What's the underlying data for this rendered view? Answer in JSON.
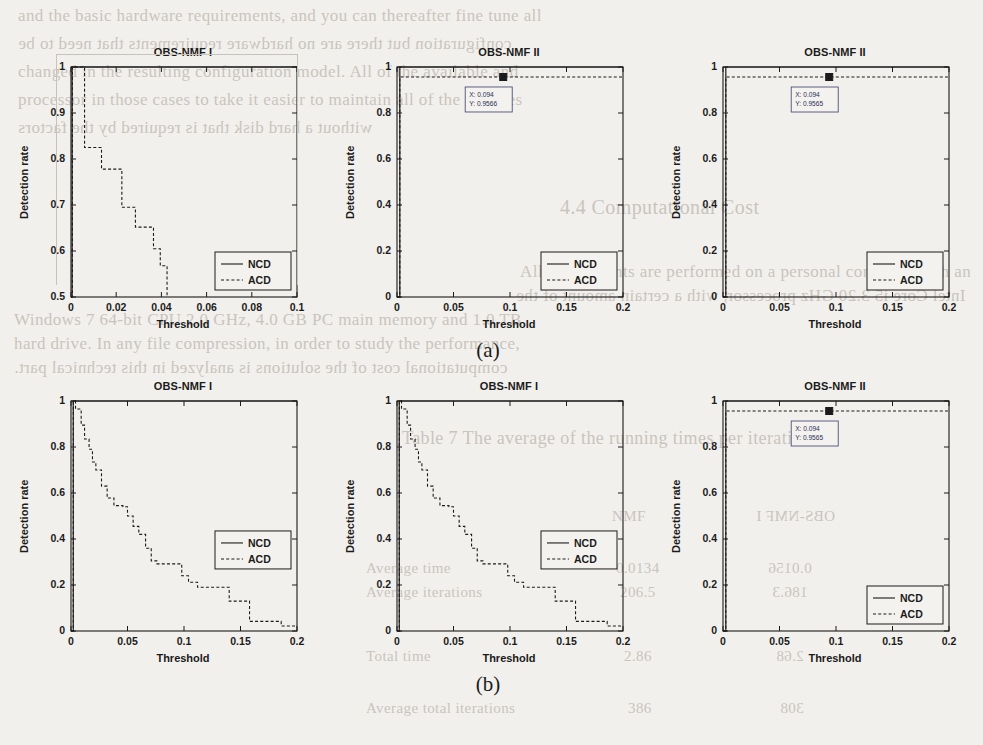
{
  "page": {
    "background_color": "#f2f0ec",
    "ink_color": "#1b1b1b",
    "bleed_color": "#b9b4ac",
    "subfigure_labels": [
      {
        "text": "(a)",
        "x": 458,
        "y": 338
      },
      {
        "text": "(b)",
        "x": 458,
        "y": 672
      }
    ],
    "bleed_text": [
      {
        "text": "and the basic hardware requirements, and you can thereafter fine tune all",
        "x": 18,
        "y": 6,
        "size": 17
      },
      {
        "text": "configuration but there are no hardware requirements that need to be",
        "x": 18,
        "y": 34,
        "size": 17
      },
      {
        "text": "changed in the resulting configuration model. All of the available and",
        "x": 18,
        "y": 62,
        "size": 17
      },
      {
        "text": "processor in those cases to take it easier to maintain all of the changes",
        "x": 18,
        "y": 90,
        "size": 17
      },
      {
        "text": "without a hard disk that is required by the factors",
        "x": 18,
        "y": 118,
        "size": 17
      },
      {
        "text": "4.4  Computational Cost",
        "x": 560,
        "y": 196,
        "size": 20
      },
      {
        "text": "All experiments are performed on a personal computer with an",
        "x": 520,
        "y": 262,
        "size": 17
      },
      {
        "text": "Intel Core i5 3.20 GHz processor, with a certain amount of the",
        "x": 516,
        "y": 286,
        "size": 17
      },
      {
        "text": "Windows 7 64-bit CPU  2.0 GHz, 4.0 GB  PC main memory and 1.0 TB",
        "x": 14,
        "y": 310,
        "size": 17
      },
      {
        "text": "hard drive. In any file compression, in order to study the performance,",
        "x": 14,
        "y": 334,
        "size": 17
      },
      {
        "text": "computational cost of the solutions is analyzed in this technical part.",
        "x": 14,
        "y": 358,
        "size": 17
      },
      {
        "text": "Table 7  The average of the running times per iteration",
        "x": 402,
        "y": 428,
        "size": 18
      },
      {
        "text": "NMF",
        "x": 612,
        "y": 508,
        "size": 15
      },
      {
        "text": "OBS-NMF I",
        "x": 756,
        "y": 508,
        "size": 15
      },
      {
        "text": "Average time",
        "x": 366,
        "y": 560,
        "size": 15
      },
      {
        "text": "0.0134",
        "x": 616,
        "y": 560,
        "size": 15
      },
      {
        "text": "0.0156",
        "x": 768,
        "y": 560,
        "size": 15
      },
      {
        "text": "Average iterations",
        "x": 366,
        "y": 584,
        "size": 15
      },
      {
        "text": "206.5",
        "x": 620,
        "y": 584,
        "size": 15
      },
      {
        "text": "186.3",
        "x": 772,
        "y": 584,
        "size": 15
      },
      {
        "text": "Total time",
        "x": 366,
        "y": 648,
        "size": 15
      },
      {
        "text": "2.86",
        "x": 624,
        "y": 648,
        "size": 15
      },
      {
        "text": "2.68",
        "x": 776,
        "y": 648,
        "size": 15
      },
      {
        "text": "Average total iterations",
        "x": 366,
        "y": 700,
        "size": 15
      },
      {
        "text": "386",
        "x": 628,
        "y": 700,
        "size": 15
      },
      {
        "text": "308",
        "x": 780,
        "y": 700,
        "size": 15
      }
    ]
  },
  "chart_data": [
    {
      "id": "panel-top-left",
      "type": "line",
      "title": "OBS-NMF I",
      "xlabel": "Threshold",
      "ylabel": "Detection rate",
      "xlim": [
        0,
        0.1
      ],
      "ylim": [
        0.5,
        1.0
      ],
      "xticks": [
        0,
        0.02,
        0.04,
        0.06,
        0.08,
        0.1
      ],
      "xticklabels": [
        "0",
        "0.02",
        "0.04",
        "0.06",
        "0.08",
        "0.1"
      ],
      "yticks": [
        0.5,
        0.6,
        0.7,
        0.8,
        0.9,
        1.0
      ],
      "yticklabels": [
        "0.5",
        "0.6",
        "0.7",
        "0.8",
        "0.9",
        "1"
      ],
      "grid": false,
      "legend_position": "lower right",
      "legend": [
        "NCD",
        "ACD"
      ],
      "series": [
        {
          "name": "NCD",
          "style": "solid",
          "x": [
            0.0,
            0.0005,
            0.0005,
            0.1
          ],
          "y": [
            0.5,
            0.5,
            1.0,
            1.0
          ]
        },
        {
          "name": "ACD",
          "style": "dashed",
          "x": [
            0.0,
            0.0006,
            0.0006,
            0.006,
            0.006,
            0.0135,
            0.0135,
            0.0225,
            0.0225,
            0.0285,
            0.0285,
            0.0365,
            0.0365,
            0.0395,
            0.0395,
            0.0425,
            0.0425
          ],
          "y": [
            0.5,
            0.5,
            1.0,
            1.0,
            0.825,
            0.825,
            0.778,
            0.778,
            0.695,
            0.695,
            0.652,
            0.652,
            0.605,
            0.605,
            0.568,
            0.568,
            0.5
          ]
        }
      ]
    },
    {
      "id": "panel-top-middle",
      "type": "line",
      "title": "OBS-NMF II",
      "xlabel": "Threshold",
      "ylabel": "Detection rate",
      "xlim": [
        0,
        0.2
      ],
      "ylim": [
        0,
        1.0
      ],
      "xticks": [
        0,
        0.05,
        0.1,
        0.15,
        0.2
      ],
      "xticklabels": [
        "0",
        "0.05",
        "0.1",
        "0.15",
        "0.2"
      ],
      "yticks": [
        0,
        0.2,
        0.4,
        0.6,
        0.8,
        1.0
      ],
      "yticklabels": [
        "0",
        "0.2",
        "0.4",
        "0.6",
        "0.8",
        "1"
      ],
      "grid": false,
      "legend_position": "lower right",
      "legend": [
        "NCD",
        "ACD"
      ],
      "datatip": {
        "x_label": "X: 0.094",
        "y_label": "Y: 0.9566",
        "x": 0.094,
        "y": 0.9566
      },
      "series": [
        {
          "name": "NCD",
          "style": "solid",
          "x": [
            0.0,
            0.0025,
            0.0025,
            0.2
          ],
          "y": [
            0.0,
            0.0,
            1.0,
            1.0
          ]
        },
        {
          "name": "ACD",
          "style": "dashed",
          "x": [
            0.0,
            0.0025,
            0.0025,
            0.2
          ],
          "y": [
            0.0,
            0.0,
            0.9566,
            0.9566
          ]
        }
      ]
    },
    {
      "id": "panel-top-right",
      "type": "line",
      "title": "OBS-NMF II",
      "xlabel": "Threshold",
      "ylabel": "Detection rate",
      "xlim": [
        0,
        0.2
      ],
      "ylim": [
        0,
        1.0
      ],
      "xticks": [
        0,
        0.05,
        0.1,
        0.15,
        0.2
      ],
      "xticklabels": [
        "0",
        "0.05",
        "0.1",
        "0.15",
        "0.2"
      ],
      "yticks": [
        0,
        0.2,
        0.4,
        0.6,
        0.8,
        1.0
      ],
      "yticklabels": [
        "0",
        "0.2",
        "0.4",
        "0.6",
        "0.8",
        "1"
      ],
      "grid": false,
      "legend_position": "lower right",
      "legend": [
        "NCD",
        "ACD"
      ],
      "datatip": {
        "x_label": "X: 0.094",
        "y_label": "Y: 0.9565",
        "x": 0.094,
        "y": 0.9565
      },
      "series": [
        {
          "name": "NCD",
          "style": "solid",
          "x": [
            0.0,
            0.0025,
            0.0025,
            0.2
          ],
          "y": [
            0.0,
            0.0,
            1.0,
            1.0
          ]
        },
        {
          "name": "ACD",
          "style": "dashed",
          "x": [
            0.0,
            0.0025,
            0.0025,
            0.2
          ],
          "y": [
            0.0,
            0.0,
            0.9565,
            0.9565
          ]
        }
      ]
    },
    {
      "id": "panel-bottom-left",
      "type": "line",
      "title": "OBS-NMF I",
      "xlabel": "Threshold",
      "ylabel": "Detection rate",
      "xlim": [
        0,
        0.2
      ],
      "ylim": [
        0,
        1.0
      ],
      "xticks": [
        0,
        0.05,
        0.1,
        0.15,
        0.2
      ],
      "xticklabels": [
        "0",
        "0.05",
        "0.1",
        "0.15",
        "0.2"
      ],
      "yticks": [
        0,
        0.2,
        0.4,
        0.6,
        0.8,
        1.0
      ],
      "yticklabels": [
        "0",
        "0.2",
        "0.4",
        "0.6",
        "0.8",
        "1"
      ],
      "grid": false,
      "legend_position": "center right",
      "legend": [
        "NCD",
        "ACD"
      ],
      "series": [
        {
          "name": "NCD",
          "style": "solid",
          "x": [
            0.0,
            0.002,
            0.002,
            0.2
          ],
          "y": [
            0.0,
            0.0,
            1.0,
            1.0
          ]
        },
        {
          "name": "ACD",
          "style": "dashed",
          "x": [
            0.0,
            0.002,
            0.002,
            0.004,
            0.004,
            0.009,
            0.009,
            0.012,
            0.012,
            0.016,
            0.016,
            0.019,
            0.019,
            0.022,
            0.022,
            0.027,
            0.027,
            0.032,
            0.032,
            0.038,
            0.038,
            0.046,
            0.046,
            0.05,
            0.05,
            0.055,
            0.055,
            0.06,
            0.06,
            0.066,
            0.066,
            0.071,
            0.071,
            0.076,
            0.076,
            0.098,
            0.098,
            0.104,
            0.104,
            0.112,
            0.112,
            0.14,
            0.14,
            0.158,
            0.158,
            0.186,
            0.186,
            0.2
          ],
          "y": [
            0.0,
            0.0,
            1.0,
            1.0,
            0.965,
            0.965,
            0.895,
            0.895,
            0.835,
            0.835,
            0.79,
            0.79,
            0.735,
            0.735,
            0.7,
            0.7,
            0.63,
            0.63,
            0.578,
            0.578,
            0.545,
            0.545,
            0.54,
            0.54,
            0.5,
            0.5,
            0.455,
            0.455,
            0.42,
            0.42,
            0.36,
            0.36,
            0.305,
            0.305,
            0.292,
            0.292,
            0.24,
            0.24,
            0.212,
            0.212,
            0.19,
            0.19,
            0.13,
            0.13,
            0.042,
            0.042,
            0.022,
            0.022
          ]
        }
      ]
    },
    {
      "id": "panel-bottom-middle",
      "type": "line",
      "title": "OBS-NMF I",
      "xlabel": "Threshold",
      "ylabel": "Detection rate",
      "xlim": [
        0,
        0.2
      ],
      "ylim": [
        0,
        1.0
      ],
      "xticks": [
        0,
        0.05,
        0.1,
        0.15,
        0.2
      ],
      "xticklabels": [
        "0",
        "0.05",
        "0.1",
        "0.15",
        "0.2"
      ],
      "yticks": [
        0,
        0.2,
        0.4,
        0.6,
        0.8,
        1.0
      ],
      "yticklabels": [
        "0",
        "0.2",
        "0.4",
        "0.6",
        "0.8",
        "1"
      ],
      "grid": false,
      "legend_position": "center right",
      "legend": [
        "NCD",
        "ACD"
      ],
      "series": [
        {
          "name": "NCD",
          "style": "solid",
          "x": [
            0.0,
            0.002,
            0.002,
            0.2
          ],
          "y": [
            0.0,
            0.0,
            1.0,
            1.0
          ]
        },
        {
          "name": "ACD",
          "style": "dashed",
          "x": [
            0.0,
            0.002,
            0.002,
            0.004,
            0.004,
            0.009,
            0.009,
            0.012,
            0.012,
            0.016,
            0.016,
            0.019,
            0.019,
            0.022,
            0.022,
            0.027,
            0.027,
            0.032,
            0.032,
            0.038,
            0.038,
            0.046,
            0.046,
            0.05,
            0.05,
            0.055,
            0.055,
            0.06,
            0.06,
            0.066,
            0.066,
            0.071,
            0.071,
            0.076,
            0.076,
            0.098,
            0.098,
            0.104,
            0.104,
            0.112,
            0.112,
            0.14,
            0.14,
            0.158,
            0.158,
            0.186,
            0.186,
            0.2
          ],
          "y": [
            0.0,
            0.0,
            1.0,
            1.0,
            0.965,
            0.965,
            0.895,
            0.895,
            0.835,
            0.835,
            0.79,
            0.79,
            0.735,
            0.735,
            0.7,
            0.7,
            0.63,
            0.63,
            0.578,
            0.578,
            0.545,
            0.545,
            0.54,
            0.54,
            0.5,
            0.5,
            0.455,
            0.455,
            0.42,
            0.42,
            0.36,
            0.36,
            0.305,
            0.305,
            0.292,
            0.292,
            0.24,
            0.24,
            0.212,
            0.212,
            0.19,
            0.19,
            0.13,
            0.13,
            0.042,
            0.042,
            0.022,
            0.022
          ]
        }
      ]
    },
    {
      "id": "panel-bottom-right",
      "type": "line",
      "title": "OBS-NMF II",
      "xlabel": "Threshold",
      "ylabel": "Detection rate",
      "xlim": [
        0,
        0.2
      ],
      "ylim": [
        0,
        1.0
      ],
      "xticks": [
        0,
        0.05,
        0.1,
        0.15,
        0.2
      ],
      "xticklabels": [
        "0",
        "0.05",
        "0.1",
        "0.15",
        "0.2"
      ],
      "yticks": [
        0,
        0.2,
        0.4,
        0.6,
        0.8,
        1.0
      ],
      "yticklabels": [
        "0",
        "0.2",
        "0.4",
        "0.6",
        "0.8",
        "1"
      ],
      "grid": false,
      "legend_position": "lower right",
      "legend": [
        "NCD",
        "ACD"
      ],
      "datatip": {
        "x_label": "X: 0.094",
        "y_label": "Y: 0.9565",
        "x": 0.094,
        "y": 0.9565
      },
      "series": [
        {
          "name": "NCD",
          "style": "solid",
          "x": [
            0.0,
            0.0025,
            0.0025,
            0.2
          ],
          "y": [
            0.0,
            0.0,
            1.0,
            1.0
          ]
        },
        {
          "name": "ACD",
          "style": "dashed",
          "x": [
            0.0,
            0.0025,
            0.0025,
            0.2
          ],
          "y": [
            0.0,
            0.0,
            0.9565,
            0.9565
          ]
        }
      ]
    }
  ],
  "layout": {
    "panels": [
      {
        "id": "panel-top-left",
        "left": 24,
        "top": 46,
        "plot_w": 226,
        "plot_h": 230,
        "pad_left": 46,
        "pad_top": 20
      },
      {
        "id": "panel-top-middle",
        "left": 350,
        "top": 46,
        "plot_w": 226,
        "plot_h": 230,
        "pad_left": 46,
        "pad_top": 20
      },
      {
        "id": "panel-top-right",
        "left": 676,
        "top": 46,
        "plot_w": 226,
        "plot_h": 230,
        "pad_left": 46,
        "pad_top": 20
      },
      {
        "id": "panel-bottom-left",
        "left": 24,
        "top": 380,
        "plot_w": 226,
        "plot_h": 230,
        "pad_left": 46,
        "pad_top": 20
      },
      {
        "id": "panel-bottom-middle",
        "left": 350,
        "top": 380,
        "plot_w": 226,
        "plot_h": 230,
        "pad_left": 46,
        "pad_top": 20
      },
      {
        "id": "panel-bottom-right",
        "left": 676,
        "top": 380,
        "plot_w": 226,
        "plot_h": 230,
        "pad_left": 46,
        "pad_top": 20
      }
    ]
  }
}
